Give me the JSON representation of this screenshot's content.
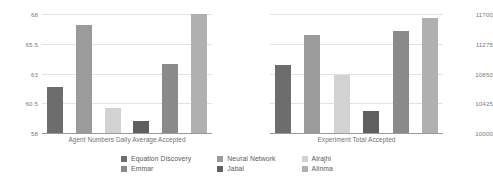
{
  "chart_data": [
    {
      "type": "bar",
      "title": "",
      "xlabel": "Agent Numbers Daily Average Accepted",
      "ylabel": "",
      "categories": [
        "Equation Discovery",
        "Emmar",
        "Neural Network",
        "Jabal",
        "Alrajhi",
        "Alinma"
      ],
      "values": [
        61.9,
        67.1,
        60.1,
        59.0,
        63.8,
        68.0
      ],
      "ylim": [
        58,
        68
      ],
      "yticks": [
        58,
        60.5,
        63,
        65.5,
        68
      ],
      "ytick_labels": [
        "58",
        "60.5",
        "63",
        "65.5",
        "68"
      ],
      "grid": true,
      "legend_position": "bottom"
    },
    {
      "type": "bar",
      "title": "",
      "xlabel": "Experiment Total Accepted",
      "ylabel": "",
      "categories": [
        "Equation Discovery",
        "Emmar",
        "Neural Network",
        "Jabal",
        "Alrajhi",
        "Alinma"
      ],
      "values": [
        10975,
        11400,
        10830,
        10320,
        11460,
        11640
      ],
      "ylim": [
        10000,
        11700
      ],
      "yticks": [
        10000,
        10425,
        10850,
        11275,
        11700
      ],
      "ytick_labels": [
        "10000",
        "10425",
        "10850",
        "11275",
        "11700"
      ],
      "grid": true,
      "legend_position": "bottom"
    }
  ],
  "legend": {
    "items": [
      {
        "label": "Equation Discovery",
        "color": "#6d6d6d"
      },
      {
        "label": "Neural Network",
        "color": "#9b9b9b"
      },
      {
        "label": "Alrajhi",
        "color": "#d2d2d2"
      },
      {
        "label": "Emmar",
        "color": "#8a8a8a"
      },
      {
        "label": "Jabal",
        "color": "#606060"
      },
      {
        "label": "Alinma",
        "color": "#b0b0b0"
      }
    ]
  },
  "series_colors": [
    "#6d6d6d",
    "#9b9b9b",
    "#d2d2d2",
    "#606060",
    "#8a8a8a",
    "#b0b0b0"
  ],
  "left_chart": {
    "xlabel": "Agent Numbers Daily Average Accepted",
    "ytick_labels": [
      "68",
      "65.5",
      "63",
      "60.5",
      "58"
    ]
  },
  "right_chart": {
    "xlabel": "Experiment Total Accepted",
    "ytick_labels": [
      "11700",
      "11275",
      "10850",
      "10425",
      "10000"
    ]
  }
}
